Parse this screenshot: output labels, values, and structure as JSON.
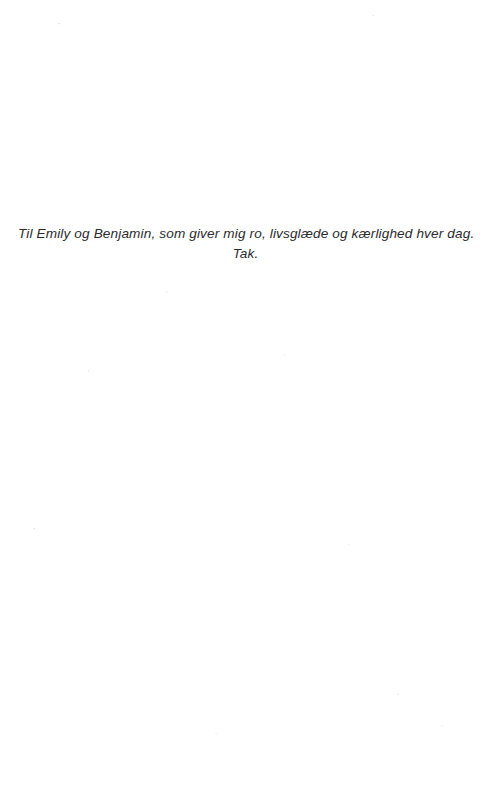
{
  "page": {
    "kind": "book-dedication-page",
    "language": "Danish",
    "background_color": "#ffffff",
    "text_color": "#2b2b2d",
    "width_px": 491,
    "height_px": 789
  },
  "dedication": {
    "lines": [
      "Til Emily og Benjamin, som giver mig ro, livsglæde og kærlighed hver dag.",
      "Tak."
    ],
    "line_1": "Til Emily og Benjamin, som giver mig ro, livsglæde og kærlighed hver dag.",
    "line_2": "Tak.",
    "alignment": "center",
    "style": "italic"
  }
}
